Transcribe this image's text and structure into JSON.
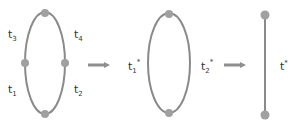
{
  "diagram": {
    "stage1": {
      "labels": [
        {
          "base": "t",
          "sub": "3",
          "sup": ""
        },
        {
          "base": "t",
          "sub": "4",
          "sup": ""
        },
        {
          "base": "t",
          "sub": "1",
          "sup": ""
        },
        {
          "base": "t",
          "sub": "2",
          "sup": ""
        }
      ],
      "nodes": 4
    },
    "stage2": {
      "labels": [
        {
          "base": "t",
          "sub": "1",
          "sup": "*"
        },
        {
          "base": "t",
          "sub": "2",
          "sup": "*"
        }
      ],
      "nodes": 2
    },
    "stage3": {
      "labels": [
        {
          "base": "t",
          "sub": "",
          "sup": "*"
        }
      ],
      "nodes": 2
    },
    "colors": {
      "edge": "#8a8a8a",
      "node": "#a0a0a0",
      "arrow": "#8f8f8f",
      "text": "#333333"
    }
  }
}
